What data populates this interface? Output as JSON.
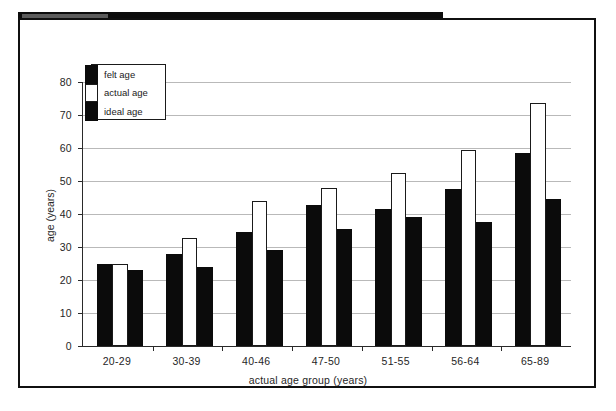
{
  "figure": {
    "label_word": "FIGURE",
    "number": "1.1",
    "caption": "Australian adults' felt and ideal ages in relation to chronological age"
  },
  "colors": {
    "dark_series": "#0b0b0b",
    "light_series": "#ffffff",
    "band": "#0d0d0d",
    "tag": "#5c5c5c",
    "grid": "#b9b9b9",
    "axis": "#2a2a2a"
  },
  "chart_data": {
    "type": "bar",
    "title": "Australian adults' felt and ideal ages in relation to chronological age",
    "xlabel": "actual age group (years)",
    "ylabel": "age (years)",
    "ylim": [
      0,
      80
    ],
    "yticks": [
      0,
      10,
      20,
      30,
      40,
      50,
      60,
      70,
      80
    ],
    "ytick_labels": [
      "0",
      "10",
      "20",
      "30",
      "40",
      "50",
      "60",
      "70",
      "80"
    ],
    "grid": true,
    "legend_position": "upper-left-inside",
    "categories": [
      "20-29",
      "30-39",
      "40-46",
      "47-50",
      "51-55",
      "56-64",
      "65-89"
    ],
    "series": [
      {
        "name": "felt age",
        "style": "dark",
        "values": [
          25.0,
          27.8,
          34.5,
          42.8,
          41.5,
          47.5,
          58.5
        ]
      },
      {
        "name": "actual age",
        "style": "light",
        "values": [
          25.0,
          32.8,
          44.0,
          47.8,
          52.5,
          59.5,
          73.5
        ]
      },
      {
        "name": "ideal age",
        "style": "dark",
        "values": [
          23.0,
          24.0,
          29.0,
          35.5,
          39.0,
          37.5,
          44.5
        ]
      }
    ]
  }
}
